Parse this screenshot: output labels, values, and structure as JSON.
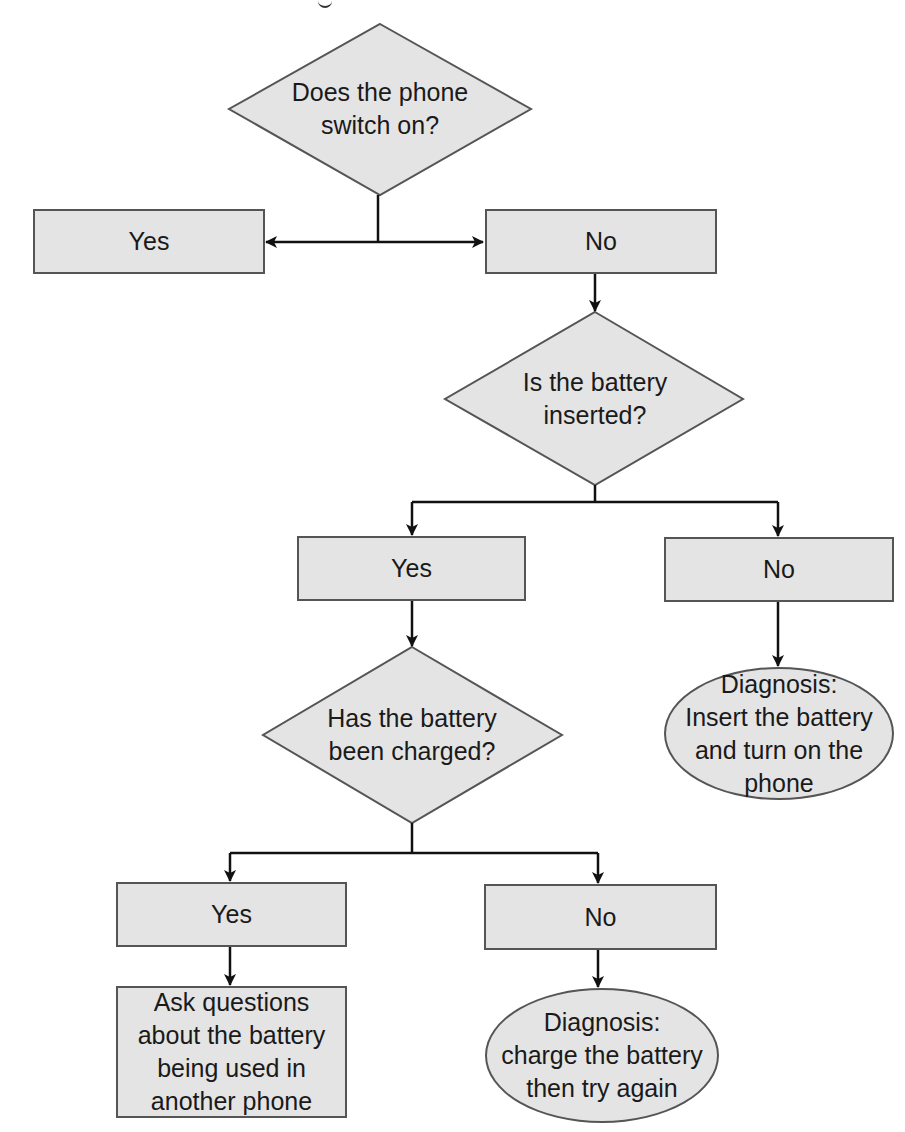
{
  "flowchart": {
    "colors": {
      "fill": "#e4e4e4",
      "stroke": "#555555",
      "arrow": "#111111",
      "text": "#1a1a1a"
    },
    "decisions": [
      {
        "id": "phone-switch-on",
        "label": "Does the phone\nswitch on?"
      },
      {
        "id": "battery-inserted",
        "label": "Is the battery\ninserted?"
      },
      {
        "id": "battery-charged",
        "label": "Has the battery\nbeen charged?"
      }
    ],
    "answers": {
      "q1_yes": "Yes",
      "q1_no": "No",
      "q2_yes": "Yes",
      "q2_no": "No",
      "q3_yes": "Yes",
      "q3_no": "No"
    },
    "actions": {
      "ask_questions": "Ask questions\nabout the battery\nbeing used in\nanother phone"
    },
    "diagnoses": {
      "insert_battery": "Diagnosis:\nInsert the battery\nand turn on the\nphone",
      "charge_battery": "Diagnosis:\ncharge the battery\nthen try again"
    }
  }
}
